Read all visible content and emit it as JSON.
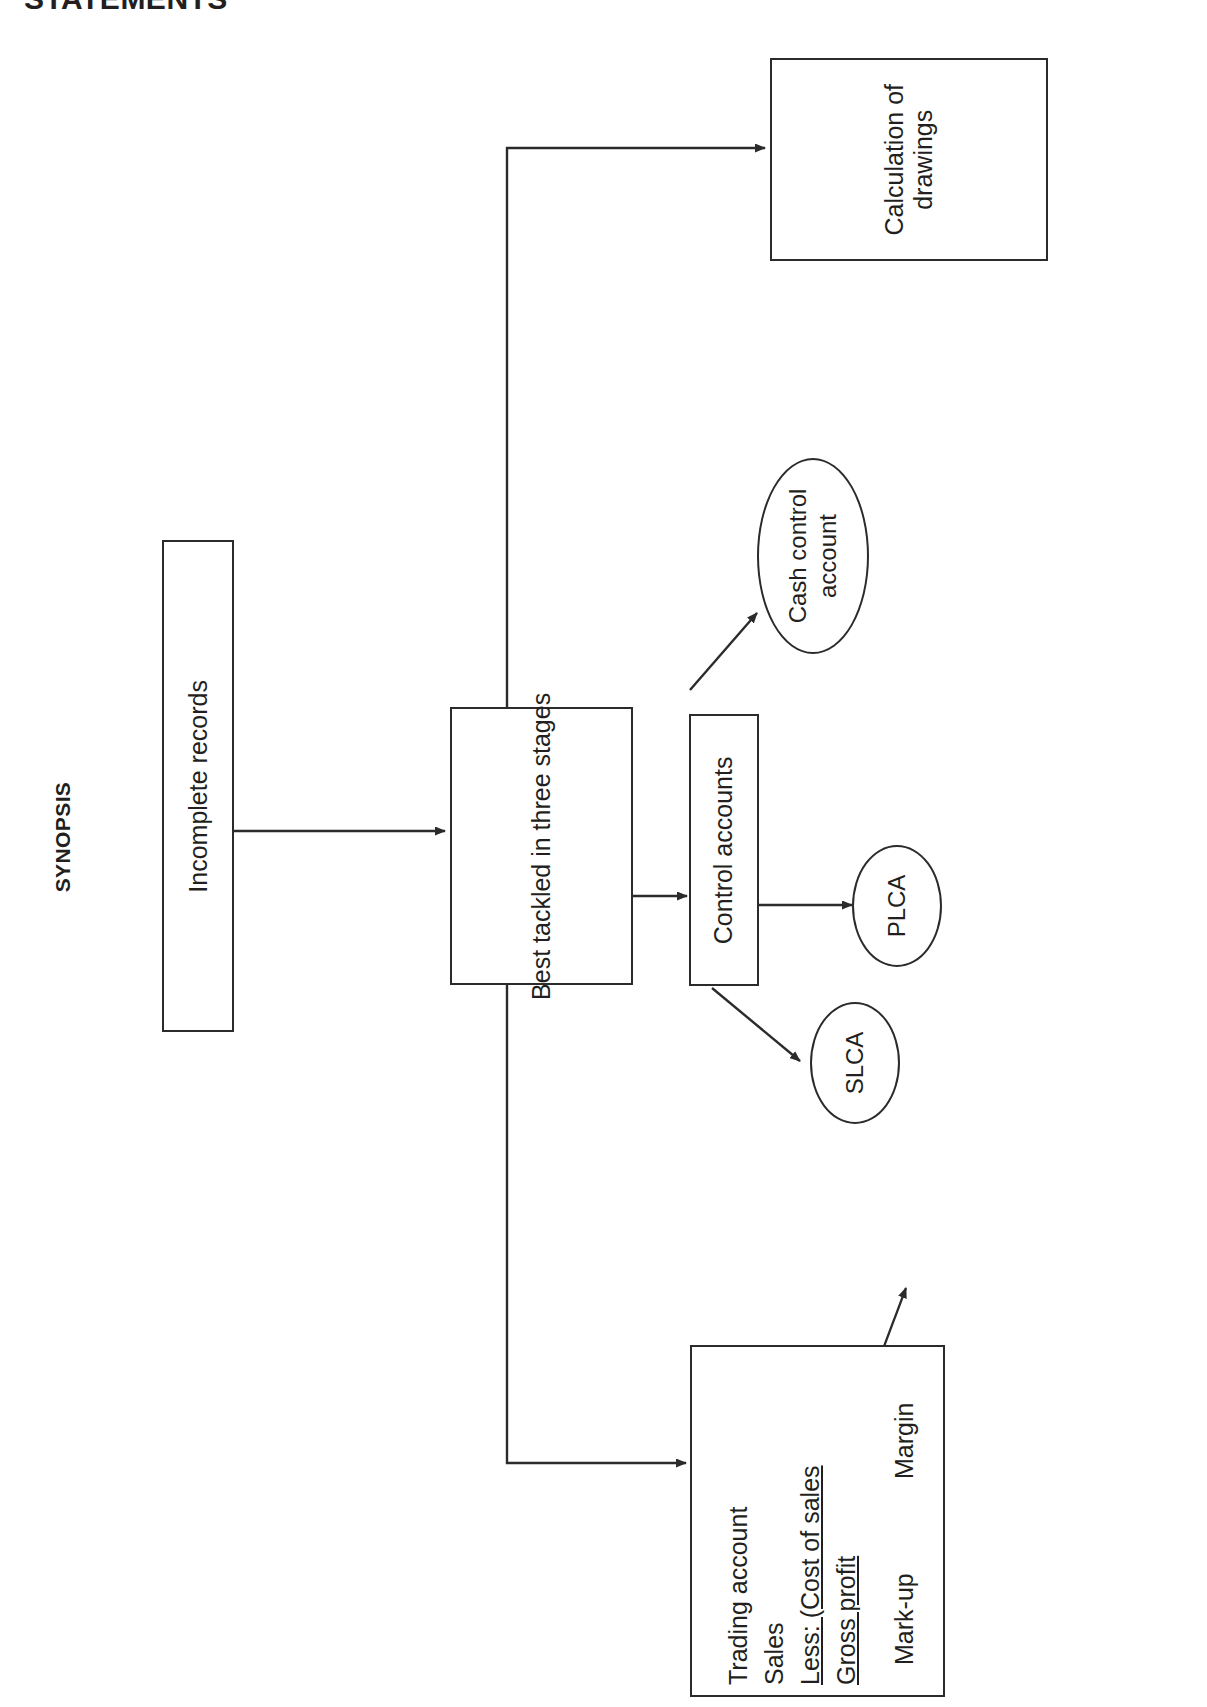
{
  "page": {
    "heading_clipped": "STATEMENTS",
    "section_label": "SYNOPSIS",
    "ink_color": "#231f20",
    "line_color": "#2b2b2b",
    "background": "#ffffff"
  },
  "diagram": {
    "type": "flowchart",
    "orientation": "rotated-90-ccw",
    "nodes": {
      "incomplete_records": {
        "label": "Incomplete records",
        "shape": "rectangle"
      },
      "best_tackled": {
        "label": "Best tackled in three stages",
        "shape": "rectangle"
      },
      "control_accounts": {
        "label": "Control accounts",
        "shape": "rectangle"
      },
      "calculation_of_drawings": {
        "label": "Calculation of drawings",
        "line1": "Calculation of",
        "line2": "drawings",
        "shape": "rectangle"
      },
      "cash_control_account": {
        "label": "Cash control account",
        "line1": "Cash control",
        "line2": "account",
        "shape": "ellipse"
      },
      "plca": {
        "label": "PLCA",
        "shape": "ellipse"
      },
      "slca": {
        "label": "SLCA",
        "shape": "ellipse"
      },
      "trading_account": {
        "shape": "rectangle",
        "lines": [
          {
            "text": "Trading account",
            "underlined": false
          },
          {
            "text": "Sales",
            "underlined": false
          },
          {
            "text": "Less: (Cost of sales",
            "underlined": true
          },
          {
            "text": "Gross profit",
            "underlined": true
          }
        ],
        "branches": [
          {
            "label": "Mark-up"
          },
          {
            "label": "Margin"
          }
        ]
      }
    },
    "edges": [
      {
        "from": "incomplete_records",
        "to": "best_tackled"
      },
      {
        "from": "best_tackled",
        "to": "control_accounts"
      },
      {
        "from": "best_tackled",
        "to": "calculation_of_drawings"
      },
      {
        "from": "best_tackled",
        "to": "trading_account"
      },
      {
        "from": "control_accounts",
        "to": "cash_control_account"
      },
      {
        "from": "control_accounts",
        "to": "plca"
      },
      {
        "from": "control_accounts",
        "to": "slca"
      },
      {
        "from": "trading_account.gross_profit",
        "to": "mark_up"
      },
      {
        "from": "trading_account.gross_profit",
        "to": "margin"
      }
    ]
  }
}
